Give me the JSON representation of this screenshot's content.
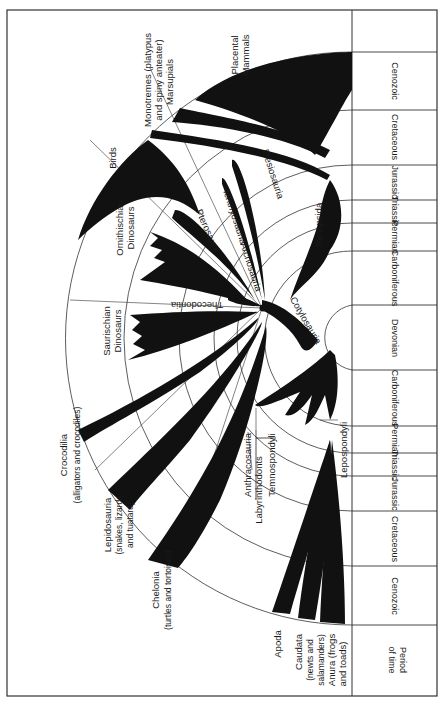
{
  "figure": {
    "colors": {
      "ink": "#111111",
      "paper": "#ffffff",
      "frame": "#333333"
    }
  },
  "time_scale": {
    "header": [
      "Period",
      "of time"
    ],
    "upper_periods": [
      {
        "name": "Cenozoic"
      },
      {
        "name": "Cretaceous"
      },
      {
        "name": "Jurassic"
      },
      {
        "name": "Triassic"
      },
      {
        "name": "Permian"
      },
      {
        "name": "Carboniferous"
      },
      {
        "name": "Devonian"
      }
    ],
    "lower_periods": [
      {
        "name": "Carboniferous"
      },
      {
        "name": "Permian"
      },
      {
        "name": "Triassic"
      },
      {
        "name": "Jurassic"
      },
      {
        "name": "Cretaceous"
      },
      {
        "name": "Cenozoic"
      }
    ]
  },
  "lineages": {
    "placental": [
      "Placental",
      "Mammals"
    ],
    "monotremes": [
      "Monotremes (platypus",
      "and spiny anteater)"
    ],
    "marsupials": "Marsupials",
    "birds": "Birds",
    "ornithischian": [
      "Ornithischian",
      "Dinosaurs"
    ],
    "saurischian": [
      "Saurischian",
      "Dinosaurs"
    ],
    "pterosaurs": "Pterosaurs",
    "thecodontia": "Thecodontia",
    "archosauria": "Archosauria",
    "ichthyosauria": "Ichthyosauria",
    "plesiosauria": "Plesiosauria",
    "synapsida": "Synapsida",
    "cotylosauria": "Cotylosauria",
    "crocodilia": [
      "Crocodilia",
      "(alligators and crocodiles)"
    ],
    "lepidosauria": [
      "Lepidosauria",
      "(snakes, lizards",
      "and tuatara)"
    ],
    "chelonia": [
      "Chelonia",
      "(turtles and tortoises)"
    ],
    "labyrinthodonts": "Labyrinthodonts",
    "anthracosauria": "Anthracosauria",
    "temnospondyli": "Temnospondyli",
    "lepospondyli": "Lepospondyli",
    "apoda": "Apoda",
    "caudata": [
      "Caudata",
      "(newts and",
      "salamanders)"
    ],
    "anura": [
      "Anura (frogs",
      "and toads)"
    ]
  }
}
